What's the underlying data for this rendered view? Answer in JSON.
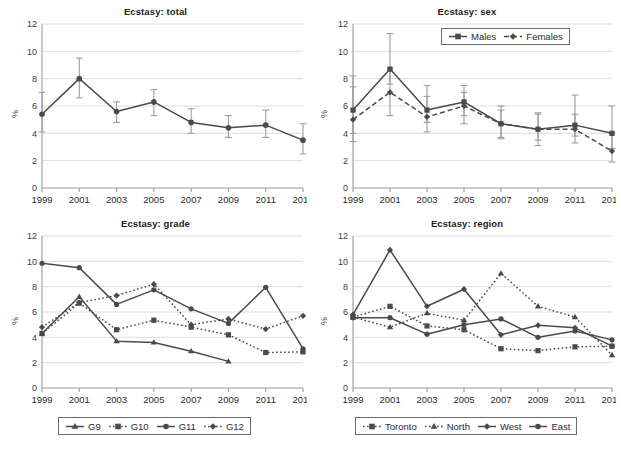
{
  "figure": {
    "background": "#ffffff",
    "line_color": "#4a4a4a",
    "errorbar_color": "#9d9d9d",
    "gridline_color": "#d4d4d4",
    "axis_color": "#9a9a9a",
    "cropped_header_text": "",
    "cropped_header_pct": ""
  },
  "axis": {
    "y_label": "%",
    "y_ticks": [
      "0",
      "2",
      "4",
      "6",
      "8",
      "10",
      "12"
    ],
    "x_ticks": [
      "1999",
      "2001",
      "2003",
      "2005",
      "2007",
      "2009",
      "2011",
      "2013"
    ]
  },
  "panels": [
    {
      "id": "total",
      "title": "Ecstasy: total"
    },
    {
      "id": "sex",
      "title": "Ecstasy: sex"
    },
    {
      "id": "grade",
      "title": "Ecstasy: grade"
    },
    {
      "id": "region",
      "title": "Ecstasy: region"
    }
  ],
  "legends": {
    "sex": [
      {
        "label": "Males",
        "marker": "square",
        "dash": "solid"
      },
      {
        "label": "Females",
        "marker": "diamond",
        "dash": "dashed"
      }
    ],
    "grade": [
      {
        "label": "G9",
        "marker": "triangle",
        "dash": "solid"
      },
      {
        "label": "G10",
        "marker": "square",
        "dash": "dotted"
      },
      {
        "label": "G11",
        "marker": "circle",
        "dash": "solid"
      },
      {
        "label": "G12",
        "marker": "diamond",
        "dash": "dotted"
      }
    ],
    "region": [
      {
        "label": "Toronto",
        "marker": "square",
        "dash": "dotted"
      },
      {
        "label": "North",
        "marker": "triangle",
        "dash": "dotted"
      },
      {
        "label": "West",
        "marker": "diamond",
        "dash": "solid"
      },
      {
        "label": "East",
        "marker": "circle",
        "dash": "solid"
      }
    ]
  },
  "chart_data": [
    {
      "type": "line",
      "id": "total",
      "title": "Ecstasy: total",
      "xlabel": "",
      "ylabel": "%",
      "x": [
        "1999",
        "2001",
        "2003",
        "2005",
        "2007",
        "2009",
        "2011",
        "2013"
      ],
      "ylim": [
        0,
        12
      ],
      "yticks": [
        0,
        2,
        4,
        6,
        8,
        10,
        12
      ],
      "grid": true,
      "legend": "none",
      "series": [
        {
          "name": "Total",
          "marker": "circle",
          "dash": "solid",
          "values": [
            5.4,
            8.0,
            5.6,
            6.3,
            4.8,
            4.4,
            4.6,
            3.5
          ],
          "error_low": [
            4.1,
            6.6,
            4.8,
            5.3,
            4.0,
            3.7,
            3.7,
            2.5
          ],
          "error_high": [
            7.0,
            9.5,
            6.3,
            7.2,
            5.8,
            5.3,
            5.7,
            4.7
          ]
        }
      ]
    },
    {
      "type": "line",
      "id": "sex",
      "title": "Ecstasy: sex",
      "xlabel": "",
      "ylabel": "%",
      "x": [
        "1999",
        "2001",
        "2003",
        "2005",
        "2007",
        "2009",
        "2011",
        "2013"
      ],
      "ylim": [
        0,
        12
      ],
      "yticks": [
        0,
        2,
        4,
        6,
        8,
        10,
        12
      ],
      "grid": true,
      "legend": "top-right",
      "series": [
        {
          "name": "Males",
          "marker": "square",
          "dash": "solid",
          "values": [
            5.7,
            8.7,
            5.7,
            6.3,
            4.7,
            4.3,
            4.6,
            4.0
          ],
          "error_low": [
            4.0,
            7.6,
            4.8,
            5.3,
            3.7,
            3.5,
            3.8,
            2.9
          ],
          "error_high": [
            8.2,
            11.3,
            7.5,
            7.5,
            5.7,
            5.5,
            6.8,
            6.0
          ]
        },
        {
          "name": "Females",
          "marker": "diamond",
          "dash": "dashed",
          "values": [
            5.0,
            7.0,
            5.2,
            6.0,
            4.7,
            4.3,
            4.3,
            2.7
          ],
          "error_low": [
            3.4,
            5.3,
            4.1,
            4.7,
            3.6,
            3.1,
            3.3,
            1.9
          ],
          "error_high": [
            7.4,
            8.7,
            6.7,
            7.0,
            6.0,
            5.4,
            5.4,
            4.0
          ]
        }
      ]
    },
    {
      "type": "line",
      "id": "grade",
      "title": "Ecstasy: grade",
      "xlabel": "",
      "ylabel": "%",
      "x": [
        "1999",
        "2001",
        "2003",
        "2005",
        "2007",
        "2009",
        "2011",
        "2013"
      ],
      "ylim": [
        0,
        12
      ],
      "yticks": [
        0,
        2,
        4,
        6,
        8,
        10,
        12
      ],
      "grid": true,
      "legend": "bottom",
      "series": [
        {
          "name": "G9",
          "marker": "triangle",
          "dash": "solid",
          "values": [
            4.3,
            7.2,
            3.7,
            3.6,
            2.9,
            2.1,
            null,
            null
          ]
        },
        {
          "name": "G10",
          "marker": "square",
          "dash": "dotted",
          "values": [
            4.3,
            6.7,
            4.6,
            5.35,
            4.8,
            4.2,
            2.8,
            2.85
          ]
        },
        {
          "name": "G11",
          "marker": "circle",
          "dash": "solid",
          "values": [
            9.85,
            9.5,
            6.6,
            7.75,
            6.25,
            5.1,
            7.95,
            3.1
          ]
        },
        {
          "name": "G12",
          "marker": "diamond",
          "dash": "dotted",
          "values": [
            4.8,
            6.75,
            7.3,
            8.2,
            5.0,
            5.45,
            4.65,
            5.7
          ]
        }
      ]
    },
    {
      "type": "line",
      "id": "region",
      "title": "Ecstasy: region",
      "xlabel": "",
      "ylabel": "%",
      "x": [
        "1999",
        "2001",
        "2003",
        "2005",
        "2007",
        "2009",
        "2011",
        "2013"
      ],
      "ylim": [
        0,
        12
      ],
      "yticks": [
        0,
        2,
        4,
        6,
        8,
        10,
        12
      ],
      "grid": true,
      "legend": "bottom",
      "series": [
        {
          "name": "Toronto",
          "marker": "square",
          "dash": "dotted",
          "values": [
            5.6,
            6.45,
            4.9,
            4.6,
            3.1,
            2.95,
            3.25,
            3.3
          ]
        },
        {
          "name": "North",
          "marker": "triangle",
          "dash": "dotted",
          "values": [
            5.6,
            4.8,
            5.9,
            5.35,
            9.05,
            6.45,
            5.6,
            2.6
          ]
        },
        {
          "name": "West",
          "marker": "diamond",
          "dash": "solid",
          "values": [
            5.8,
            10.9,
            6.45,
            7.8,
            4.2,
            4.95,
            4.75,
            3.3
          ]
        },
        {
          "name": "East",
          "marker": "circle",
          "dash": "solid",
          "values": [
            5.55,
            5.55,
            4.25,
            5.0,
            5.45,
            4.0,
            4.5,
            3.8
          ]
        }
      ]
    }
  ]
}
